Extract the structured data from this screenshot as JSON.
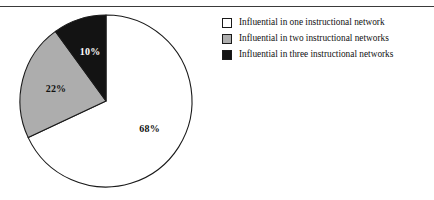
{
  "figure": {
    "background_color": "#ffffff",
    "rule_color": "#3a3a3a",
    "outline_color": "#1a1a1a"
  },
  "chart_data": {
    "type": "pie",
    "title": "",
    "subtitle": "",
    "xlabel": "",
    "ylabel": "",
    "legend_position": "right",
    "grid": false,
    "start_angle_oclock": 12,
    "direction": "clockwise",
    "categories": [
      "Influential in one instructional network",
      "Influential in two instructional networks",
      "Influential in three instructional networks"
    ],
    "values": [
      68,
      22,
      10
    ],
    "value_unit": "%",
    "data_labels": [
      "68%",
      "22%",
      "10%"
    ],
    "slice_colors": [
      "#ffffff",
      "#adadad",
      "#131313"
    ],
    "label_text_colors": [
      "#111111",
      "#111111",
      "#ffffff"
    ],
    "slices": [
      {
        "label": "Influential in one instructional network",
        "value": 68,
        "data_label": "68%",
        "fill": "#ffffff",
        "label_color": "#111111"
      },
      {
        "label": "Influential in two instructional networks",
        "value": 22,
        "data_label": "22%",
        "fill": "#adadad",
        "label_color": "#111111"
      },
      {
        "label": "Influential in three instructional networks",
        "value": 10,
        "data_label": "10%",
        "fill": "#131313",
        "label_color": "#ffffff"
      }
    ]
  },
  "legend": {
    "items": [
      {
        "label": "Influential in one instructional network",
        "swatch_color": "#ffffff"
      },
      {
        "label": "Influential in two instructional networks",
        "swatch_color": "#adadad"
      },
      {
        "label": "Influential in three instructional networks",
        "swatch_color": "#131313"
      }
    ]
  }
}
